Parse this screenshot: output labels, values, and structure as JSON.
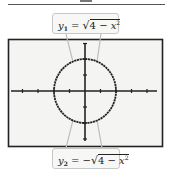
{
  "figure": {
    "top_label": {
      "var": "y",
      "subscript": "1",
      "equals": " = ",
      "sign": "",
      "radical": "√",
      "radicand_const": "4 − ",
      "radicand_var": "x",
      "exponent": "2"
    },
    "bottom_label": {
      "var": "y",
      "subscript": "2",
      "equals": " = ",
      "sign": "−",
      "radical": "√",
      "radicand_const": "4 − ",
      "radicand_var": "x",
      "exponent": "2"
    },
    "graph": {
      "curve": "circle x^2 + y^2 = 4",
      "radius_units": 2,
      "x_ticks": [
        -4,
        -3,
        -2,
        -1,
        1,
        2,
        3,
        4
      ],
      "y_ticks": [
        -3,
        -2,
        -1,
        1,
        2,
        3
      ]
    },
    "colors": {
      "frame": "#222222",
      "screen_bg": "#f4f4f2",
      "curve": "#222222",
      "connector": "#bdbdbd",
      "label_bg": "#f7f7f5",
      "label_border": "#c8c8c8"
    }
  }
}
